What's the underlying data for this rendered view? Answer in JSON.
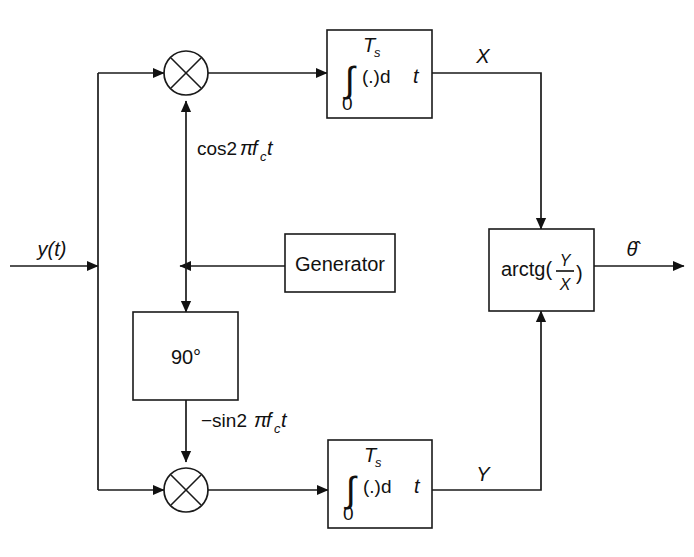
{
  "diagram": {
    "input_signal_label": "y(t)",
    "output_signal_label": "θ̂",
    "branch_labels": {
      "top_out": "X",
      "bottom_out": "Y"
    },
    "carrier_labels": {
      "inphase": "cos2πfᴄt",
      "inphase_prefix": "cos2",
      "inphase_pi": "π",
      "inphase_f": "f",
      "inphase_sub": "c",
      "inphase_t": "t",
      "quadrature": "−sin2πfᴄt",
      "quadrature_prefix": "−sin2",
      "quadrature_pi": "π",
      "quadrature_f": "f",
      "quadrature_sub": "c",
      "quadrature_t": "t"
    },
    "blocks": [
      {
        "id": "integrator-top",
        "name": "integrator-upper",
        "symbol": "∫",
        "upper_limit": "T",
        "upper_limit_sub": "s",
        "lower_limit": "0",
        "integrand": "(.)d",
        "integrand_var": "t"
      },
      {
        "id": "integrator-bottom",
        "name": "integrator-lower",
        "symbol": "∫",
        "upper_limit": "T",
        "upper_limit_sub": "s",
        "lower_limit": "0",
        "integrand": "(.)d",
        "integrand_var": "t"
      },
      {
        "id": "generator",
        "name": "generator",
        "label": "Generator"
      },
      {
        "id": "phase-shift",
        "name": "phase-shifter",
        "label": "90°"
      },
      {
        "id": "arctangent",
        "name": "arctangent",
        "label_prefix": "arctg(",
        "numerator": "Y",
        "denominator": "X",
        "label_suffix": ")"
      }
    ],
    "mixers": [
      {
        "id": "mixer-top",
        "symbol": "⊗"
      },
      {
        "id": "mixer-bottom",
        "symbol": "⊗"
      }
    ],
    "colors": {
      "line": "#1a1a1a",
      "background": "#ffffff",
      "text": "#111111"
    }
  }
}
